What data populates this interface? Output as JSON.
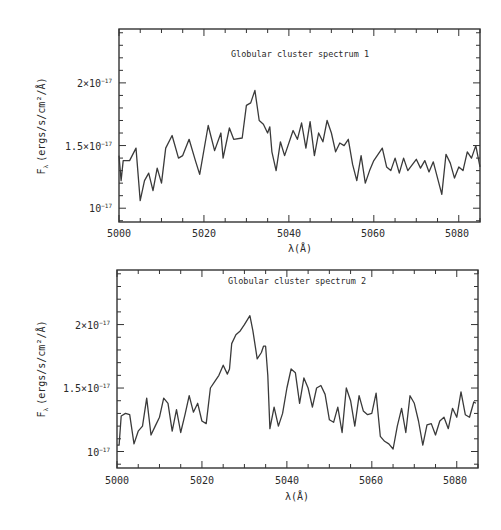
{
  "chart_data": [
    {
      "type": "line",
      "title": "Globular cluster spectrum 1",
      "xlabel": "λ(Å)",
      "ylabel": "F_λ (ergs/s/cm²/Å)",
      "xlim": [
        5000,
        5085
      ],
      "ylim": [
        0.89,
        2.43
      ],
      "y_unit_scale": "1e-17",
      "x_ticks": [
        5000,
        5020,
        5040,
        5060,
        5080
      ],
      "x_tick_labels": [
        "5000",
        "5020",
        "5040",
        "5060",
        "5080"
      ],
      "y_ticks": [
        1.0,
        1.5,
        2.0
      ],
      "y_tick_labels": [
        "10⁻¹⁷",
        "1.5×10⁻¹⁷",
        "2×10⁻¹⁷"
      ],
      "grid": false,
      "legend": null,
      "series": [
        {
          "name": "Globular cluster spectrum 1",
          "x": [
            5000,
            5000.5,
            5001,
            5002.5,
            5004,
            5005,
            5006,
            5007,
            5008,
            5009,
            5010,
            5011,
            5012.5,
            5014,
            5015,
            5016.5,
            5018,
            5019,
            5021,
            5022.5,
            5024,
            5024.5,
            5026,
            5027,
            5029,
            5030,
            5031,
            5032,
            5033,
            5034,
            5035,
            5035.5,
            5036,
            5037,
            5038,
            5039,
            5041,
            5042,
            5043,
            5044,
            5045,
            5046,
            5047,
            5048,
            5049,
            5050,
            5051,
            5052,
            5053,
            5054,
            5055,
            5056,
            5057,
            5058,
            5059,
            5060,
            5062,
            5063,
            5064,
            5065,
            5066,
            5067,
            5068,
            5070,
            5071,
            5072,
            5073,
            5074,
            5076,
            5077,
            5078,
            5079,
            5080,
            5081,
            5082,
            5083,
            5084,
            5085
          ],
          "y": [
            1.42,
            1.22,
            1.38,
            1.38,
            1.48,
            1.06,
            1.22,
            1.28,
            1.14,
            1.32,
            1.2,
            1.48,
            1.58,
            1.4,
            1.42,
            1.55,
            1.38,
            1.27,
            1.66,
            1.46,
            1.6,
            1.4,
            1.64,
            1.55,
            1.56,
            1.82,
            1.84,
            1.94,
            1.7,
            1.67,
            1.6,
            1.65,
            1.45,
            1.3,
            1.53,
            1.42,
            1.62,
            1.55,
            1.68,
            1.48,
            1.69,
            1.42,
            1.6,
            1.53,
            1.7,
            1.6,
            1.45,
            1.52,
            1.5,
            1.55,
            1.35,
            1.22,
            1.42,
            1.2,
            1.3,
            1.38,
            1.48,
            1.33,
            1.3,
            1.4,
            1.28,
            1.4,
            1.3,
            1.39,
            1.32,
            1.38,
            1.29,
            1.37,
            1.11,
            1.43,
            1.36,
            1.24,
            1.33,
            1.3,
            1.45,
            1.4,
            1.5,
            1.33
          ]
        }
      ]
    },
    {
      "type": "line",
      "title": "Globular cluster spectrum 2",
      "xlabel": "λ(Å)",
      "ylabel": "F_λ (ergs/s/cm²/Å)",
      "xlim": [
        5000,
        5085
      ],
      "ylim": [
        0.87,
        2.43
      ],
      "y_unit_scale": "1e-17",
      "x_ticks": [
        5000,
        5020,
        5040,
        5060,
        5080
      ],
      "x_tick_labels": [
        "5000",
        "5020",
        "5040",
        "5060",
        "5080"
      ],
      "y_ticks": [
        1.0,
        1.5,
        2.0
      ],
      "y_tick_labels": [
        "10⁻¹⁷",
        "1.5×10⁻¹⁷",
        "2×10⁻¹⁷"
      ],
      "grid": false,
      "legend": null,
      "series": [
        {
          "name": "Globular cluster spectrum 2",
          "x": [
            5000,
            5000.5,
            5001,
            5002,
            5003,
            5004,
            5005,
            5006,
            5007,
            5008,
            5009,
            5010,
            5011,
            5012,
            5013,
            5014,
            5015,
            5016,
            5017,
            5018,
            5019,
            5020,
            5021,
            5022,
            5023,
            5024,
            5025,
            5026,
            5026.5,
            5027,
            5028,
            5029,
            5030,
            5031.3,
            5032,
            5033,
            5034,
            5034.5,
            5035,
            5035.5,
            5036,
            5037,
            5038,
            5039,
            5040,
            5041,
            5042,
            5043,
            5044,
            5045,
            5046,
            5047,
            5048,
            5049,
            5050,
            5051,
            5052,
            5053,
            5054,
            5055,
            5056,
            5057,
            5058,
            5059,
            5060,
            5061,
            5062,
            5063,
            5064,
            5065,
            5066,
            5067,
            5068,
            5069,
            5070,
            5071,
            5072,
            5073,
            5074,
            5075,
            5076,
            5077,
            5078,
            5079,
            5080,
            5081,
            5082,
            5083,
            5084,
            5084.5
          ],
          "y": [
            1.05,
            1.05,
            1.28,
            1.3,
            1.29,
            1.06,
            1.16,
            1.2,
            1.42,
            1.13,
            1.2,
            1.27,
            1.42,
            1.38,
            1.16,
            1.33,
            1.15,
            1.29,
            1.44,
            1.31,
            1.38,
            1.24,
            1.22,
            1.5,
            1.55,
            1.6,
            1.68,
            1.61,
            1.65,
            1.85,
            1.92,
            1.95,
            2.0,
            2.07,
            1.95,
            1.73,
            1.78,
            1.83,
            1.83,
            1.6,
            1.18,
            1.35,
            1.2,
            1.3,
            1.5,
            1.65,
            1.62,
            1.38,
            1.58,
            1.5,
            1.35,
            1.5,
            1.52,
            1.45,
            1.25,
            1.23,
            1.35,
            1.15,
            1.5,
            1.4,
            1.2,
            1.44,
            1.32,
            1.29,
            1.3,
            1.46,
            1.12,
            1.08,
            1.06,
            1.02,
            1.2,
            1.34,
            1.15,
            1.44,
            1.38,
            1.24,
            1.05,
            1.21,
            1.22,
            1.13,
            1.24,
            1.27,
            1.18,
            1.34,
            1.27,
            1.47,
            1.29,
            1.27,
            1.39,
            1.38
          ]
        }
      ]
    }
  ],
  "panels": [
    {
      "title": "Globular cluster spectrum 1"
    },
    {
      "title": "Globular cluster spectrum 2"
    }
  ],
  "axes": {
    "xlabel": "λ(Å)",
    "ylabel": "F_λ (ergs/s/cm²/Å)",
    "ylabel_symbol": "F",
    "ylabel_subscript": "λ",
    "ylabel_units": "(ergs/s/cm²/Å)",
    "x_tick_labels": [
      "5000",
      "5020",
      "5040",
      "5060",
      "5080"
    ],
    "y_tick_labels": {
      "one": "10",
      "one_exp": "−17",
      "one_five": "1.5×10",
      "one_five_exp": "−17",
      "two": "2×10",
      "two_exp": "−17"
    }
  },
  "colors": {
    "line": "#3a3a3a",
    "frame": "#333333",
    "background": "#ffffff"
  }
}
